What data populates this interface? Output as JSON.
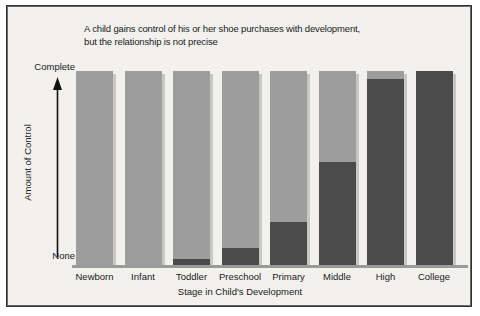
{
  "chart_data": {
    "type": "bar",
    "title": "A child gains control of his or her shoe purchases with development, but the relationship is not precise",
    "title_lines": [
      "A child gains control of his or her shoe purchases with development,",
      "but the relationship is not precise"
    ],
    "xlabel": "Stage in Child's Development",
    "ylabel": "Amount of Control",
    "categories": [
      "Newborn",
      "Infant",
      "Toddler",
      "Preschool",
      "Primary",
      "Middle",
      "High",
      "College"
    ],
    "ytick_labels": [
      "Complete",
      "None"
    ],
    "ylim": [
      0,
      100
    ],
    "grid": false,
    "legend": null,
    "stacked": true,
    "series": [
      {
        "name": "Child's control",
        "color": "#4b4b4b",
        "values": [
          0,
          0,
          3,
          9,
          22,
          53,
          96,
          100
        ]
      },
      {
        "name": "Parent's control",
        "color": "#9d9d9d",
        "values": [
          100,
          100,
          97,
          91,
          78,
          47,
          4,
          0
        ]
      }
    ],
    "colors": {
      "light_gray": "#9d9d9d",
      "dark_gray": "#4b4b4b",
      "shadow": "#c9c7c3",
      "background": "#f2f1ee",
      "axis": "#9a9a9a",
      "border": "#2f2f2f",
      "text": "#1a1a1a"
    },
    "annotations": {
      "y_axis_arrow": "upward-arrow"
    }
  }
}
